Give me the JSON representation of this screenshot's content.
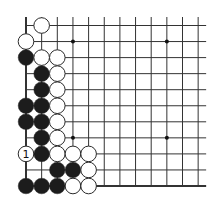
{
  "diagram": {
    "type": "go-board-fragment",
    "colors": {
      "background": "#ffffff",
      "line": "#333333",
      "black_stone": "#1c1c1c",
      "white_stone": "#ffffff",
      "stone_outline": "#2a2a2a"
    },
    "grid": {
      "columns": 12,
      "rows": 11,
      "origin_x": 26,
      "origin_y": 25.5,
      "spacing_x": 15.65,
      "spacing_y": 16.05,
      "edges": [
        "left",
        "bottom"
      ]
    },
    "star_points": [
      {
        "col": 3,
        "row": 1
      },
      {
        "col": 9,
        "row": 1
      },
      {
        "col": 3,
        "row": 7
      },
      {
        "col": 9,
        "row": 7
      }
    ],
    "stones": [
      {
        "color": "white",
        "col": 1,
        "row": 0
      },
      {
        "color": "white",
        "col": 0,
        "row": 1
      },
      {
        "color": "black",
        "col": 0,
        "row": 2
      },
      {
        "color": "white",
        "col": 1,
        "row": 2
      },
      {
        "color": "white",
        "col": 2,
        "row": 2
      },
      {
        "color": "black",
        "col": 1,
        "row": 3
      },
      {
        "color": "white",
        "col": 2,
        "row": 3
      },
      {
        "color": "black",
        "col": 1,
        "row": 4
      },
      {
        "color": "white",
        "col": 2,
        "row": 4
      },
      {
        "color": "black",
        "col": 0,
        "row": 5
      },
      {
        "color": "black",
        "col": 1,
        "row": 5
      },
      {
        "color": "white",
        "col": 2,
        "row": 5
      },
      {
        "color": "black",
        "col": 0,
        "row": 6
      },
      {
        "color": "black",
        "col": 1,
        "row": 6
      },
      {
        "color": "white",
        "col": 2,
        "row": 6
      },
      {
        "color": "black",
        "col": 1,
        "row": 7
      },
      {
        "color": "white",
        "col": 2,
        "row": 7
      },
      {
        "color": "white",
        "col": 0,
        "row": 8,
        "label": "1"
      },
      {
        "color": "black",
        "col": 1,
        "row": 8
      },
      {
        "color": "white",
        "col": 2,
        "row": 8
      },
      {
        "color": "white",
        "col": 3,
        "row": 8
      },
      {
        "color": "white",
        "col": 4,
        "row": 8
      },
      {
        "color": "black",
        "col": 2,
        "row": 9
      },
      {
        "color": "black",
        "col": 3,
        "row": 9
      },
      {
        "color": "white",
        "col": 4,
        "row": 9
      },
      {
        "color": "black",
        "col": 0,
        "row": 10
      },
      {
        "color": "black",
        "col": 1,
        "row": 10
      },
      {
        "color": "black",
        "col": 2,
        "row": 10
      },
      {
        "color": "white",
        "col": 3,
        "row": 10
      },
      {
        "color": "white",
        "col": 4,
        "row": 10
      }
    ],
    "move_label": "1"
  }
}
